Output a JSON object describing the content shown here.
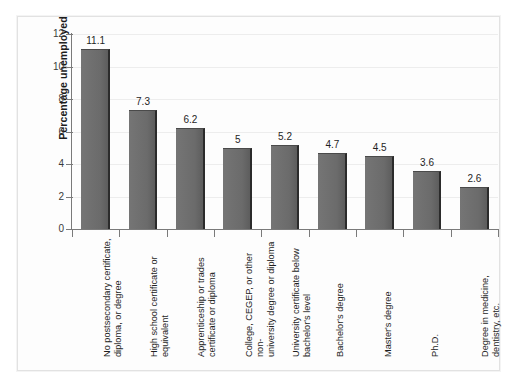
{
  "chart_data": {
    "type": "bar",
    "title": "",
    "xlabel": "",
    "ylabel": "Percentage unemployed",
    "ylim": [
      0,
      12
    ],
    "yticks": [
      "0",
      "2",
      "4",
      "6",
      "8",
      "10",
      "12"
    ],
    "grid": true,
    "legend": "none",
    "bar_color": "#6d6d6d",
    "categories": [
      "No postsecondary certificate,\ndiploma, or degree",
      "High school certificate or\nequivalent",
      "Apprenticeship or trades\ncertificate or diploma",
      "College, CEGEP, or other non-\nuniversity degree or diploma",
      "University certificate below\nbachelor's level",
      "Bachelor's degree",
      "Master's degree",
      "Ph.D.",
      "Degree in medicine,\ndentistry, etc."
    ],
    "values": [
      11.1,
      7.3,
      6.2,
      5,
      5.2,
      4.7,
      4.5,
      3.6,
      2.6
    ],
    "value_labels": [
      "11.1",
      "7.3",
      "6.2",
      "5",
      "5.2",
      "4.7",
      "4.5",
      "3.6",
      "2.6"
    ]
  }
}
